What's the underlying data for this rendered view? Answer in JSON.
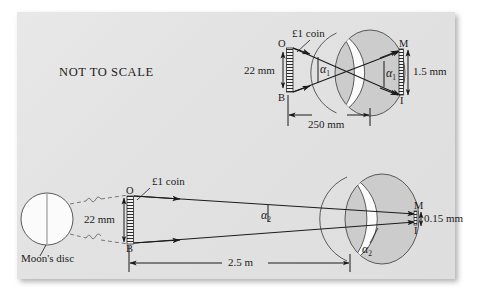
{
  "figure": {
    "background_color": "#e4e4e4",
    "page_color": "#ffffff",
    "ink_color": "#1b1b1b",
    "eye_fill": "#c9c9c9",
    "note": "NOT TO SCALE"
  },
  "diagram_top": {
    "caption": "NOT TO SCALE",
    "object_label": "£1 coin",
    "object_top_point": "O",
    "object_bottom_point": "B",
    "object_size": "22 mm",
    "angle_object": "α",
    "angle_object_sub": "1",
    "angle_image": "α",
    "angle_image_sub": "1",
    "distance": "250 mm",
    "image_top_point": "M",
    "image_bottom_point": "I",
    "image_size": "1.5 mm"
  },
  "diagram_bottom": {
    "source_label": "Moon's disc",
    "object_label": "£1 coin",
    "object_top_point": "O",
    "object_bottom_point": "B",
    "object_size": "22 mm",
    "angle_object": "α",
    "angle_object_sub": "2",
    "angle_image": "α",
    "angle_image_sub": "2",
    "distance": "2.5 m",
    "image_top_point": "M",
    "image_bottom_point": "I",
    "image_size": "0.15 mm"
  }
}
